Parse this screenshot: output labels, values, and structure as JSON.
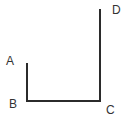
{
  "diagram": {
    "line_color": "#2b2b2b",
    "points": {
      "A": {
        "label": "A",
        "x": 27,
        "y": 63
      },
      "B": {
        "label": "B",
        "x": 27,
        "y": 101
      },
      "C": {
        "label": "C",
        "x": 100,
        "y": 101
      },
      "D": {
        "label": "D",
        "x": 100,
        "y": 9
      }
    },
    "segments": [
      {
        "from": "A",
        "to": "B"
      },
      {
        "from": "B",
        "to": "C"
      },
      {
        "from": "C",
        "to": "D"
      }
    ]
  }
}
